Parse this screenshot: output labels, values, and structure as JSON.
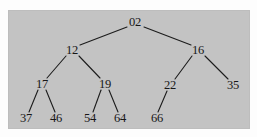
{
  "figure": {
    "kind": "binary-tree-diagram",
    "background_color": "#c3c3c3",
    "page_color": "#fdfdfd",
    "edge_color": "#1c1c1c",
    "text_color": "#171717"
  },
  "tree": {
    "nodes": [
      {
        "id": "n02",
        "label": "02",
        "x": 135,
        "y": 22,
        "level": 0
      },
      {
        "id": "n12",
        "label": "12",
        "x": 72,
        "y": 50,
        "level": 1
      },
      {
        "id": "n16",
        "label": "16",
        "x": 198,
        "y": 50,
        "level": 1
      },
      {
        "id": "n17",
        "label": "17",
        "x": 42,
        "y": 84,
        "level": 2
      },
      {
        "id": "n19",
        "label": "19",
        "x": 105,
        "y": 84,
        "level": 2
      },
      {
        "id": "n22",
        "label": "22",
        "x": 170,
        "y": 85,
        "level": 2
      },
      {
        "id": "n35",
        "label": "35",
        "x": 233,
        "y": 85,
        "level": 2
      },
      {
        "id": "n37",
        "label": "37",
        "x": 26,
        "y": 118,
        "level": 3
      },
      {
        "id": "n46",
        "label": "46",
        "x": 56,
        "y": 118,
        "level": 3
      },
      {
        "id": "n54",
        "label": "54",
        "x": 90,
        "y": 118,
        "level": 3
      },
      {
        "id": "n64",
        "label": "64",
        "x": 120,
        "y": 118,
        "level": 3
      },
      {
        "id": "n66",
        "label": "66",
        "x": 157,
        "y": 118,
        "level": 3
      }
    ],
    "edges": [
      {
        "from": "n02",
        "to": "n12",
        "x1": 127,
        "y1": 27,
        "x2": 80,
        "y2": 45
      },
      {
        "from": "n02",
        "to": "n16",
        "x1": 144,
        "y1": 27,
        "x2": 191,
        "y2": 45
      },
      {
        "from": "n12",
        "to": "n17",
        "x1": 66,
        "y1": 56,
        "x2": 47,
        "y2": 78
      },
      {
        "from": "n12",
        "to": "n19",
        "x1": 79,
        "y1": 56,
        "x2": 100,
        "y2": 78
      },
      {
        "from": "n16",
        "to": "n22",
        "x1": 192,
        "y1": 56,
        "x2": 175,
        "y2": 79
      },
      {
        "from": "n16",
        "to": "n35",
        "x1": 205,
        "y1": 56,
        "x2": 228,
        "y2": 79
      },
      {
        "from": "n17",
        "to": "n37",
        "x1": 38,
        "y1": 90,
        "x2": 29,
        "y2": 112
      },
      {
        "from": "n17",
        "to": "n46",
        "x1": 46,
        "y1": 90,
        "x2": 55,
        "y2": 112
      },
      {
        "from": "n19",
        "to": "n54",
        "x1": 101,
        "y1": 90,
        "x2": 93,
        "y2": 112
      },
      {
        "from": "n19",
        "to": "n64",
        "x1": 109,
        "y1": 90,
        "x2": 118,
        "y2": 112
      },
      {
        "from": "n22",
        "to": "n66",
        "x1": 167,
        "y1": 91,
        "x2": 158,
        "y2": 112
      }
    ]
  }
}
